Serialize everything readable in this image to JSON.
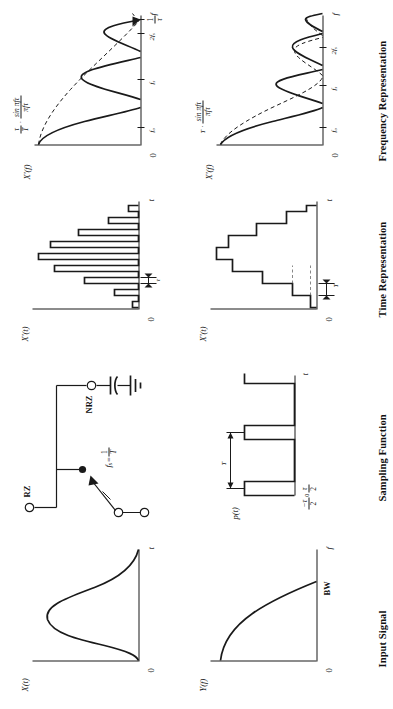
{
  "figure": {
    "caption": "Figure 6.1 Sampled-data systems: RZ and NRZ sampling",
    "columns": [
      {
        "id": "input-signal",
        "title": "Input Signal"
      },
      {
        "id": "sampling-function",
        "title": "Sampling Function"
      },
      {
        "id": "time-representation",
        "title": "Time Representation"
      },
      {
        "id": "frequency-representation",
        "title": "Frequency Representation"
      }
    ]
  },
  "input_signal": {
    "time_plot": {
      "y_label": "X(t)",
      "x_label": "t",
      "origin_label": "0",
      "curve": "bell-shaped time waveform"
    },
    "spectrum_plot": {
      "y_label": "Y(f)",
      "x_label": "f",
      "origin_label": "0",
      "bandwidth_label": "BW",
      "curve": "rising lowpass spectrum to BW"
    }
  },
  "sampling_function": {
    "switch": {
      "rate_label_lead": "f",
      "rate_label_sub": "s",
      "rate_label_eq": " = ",
      "rate_fraction_num": "1",
      "rate_fraction_den": "T",
      "terminal_rz": "RZ",
      "terminal_nrz": "NRZ",
      "hold_component": "capacitor-to-ground"
    },
    "pulse_train": {
      "label": "p(t)",
      "x_label": "t",
      "period_label": "T",
      "left_edge_num": "−τ",
      "left_edge_den": "2",
      "right_edge_num": "τ",
      "right_edge_den": "2",
      "origin_label": "0"
    }
  },
  "rz": {
    "time": {
      "y_label": "X'(t)",
      "x_label": "t",
      "origin_label": "0",
      "width_label": "τ",
      "description": "narrow return-to-zero sample pulses following the input envelope"
    },
    "frequency": {
      "y_label": "X'(f)",
      "x_label": "f",
      "origin_label": "0",
      "envelope_prefix_num": "τ",
      "envelope_prefix_den": "T",
      "envelope_dot": "·",
      "envelope_num": "sin πfτ",
      "envelope_den": "πfτ",
      "ticks": [
        {
          "label": "f",
          "sub": "o"
        },
        {
          "label": "f",
          "sub": "s"
        },
        {
          "label": "2f",
          "sub": "s"
        }
      ],
      "null_tick_num": "1",
      "null_tick_den": "τ"
    }
  },
  "nrz": {
    "time": {
      "y_label": "X'(t)",
      "x_label": "t",
      "origin_label": "0",
      "period_label": "T",
      "description": "staircase non-return-to-zero sample-and-hold waveform"
    },
    "frequency": {
      "y_label": "X'(f)",
      "x_label": "f",
      "origin_label": "0",
      "envelope_prefix": "T",
      "envelope_dot": "·",
      "envelope_num": "sin πfτ",
      "envelope_den": "πfτ",
      "ticks": [
        {
          "label": "f",
          "sub": "o"
        },
        {
          "label": "f",
          "sub": "s"
        },
        {
          "label": "2f",
          "sub": "s"
        }
      ]
    }
  },
  "colors": {
    "ink": "#1a1a1a",
    "paper": "#ffffff",
    "faint": "#555555"
  }
}
